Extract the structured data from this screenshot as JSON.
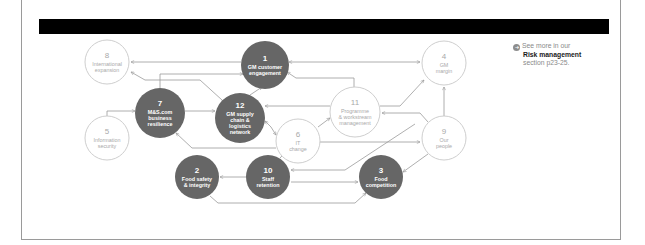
{
  "colors": {
    "filled_node": "#666666",
    "outline_node_stroke": "#c8c8c8",
    "outline_text": "#a9a9a9",
    "connector": "#9a9a9a",
    "redaction": "#000000",
    "frame_border": "#9a9a9a"
  },
  "note": {
    "icon": "more-info-icon",
    "line1": "See more in our",
    "line2": "Risk management",
    "line3": "section p23-25."
  },
  "nodes": [
    {
      "id": "1",
      "number": "1",
      "lines": [
        "GM customer",
        "engagement"
      ],
      "style": "filled",
      "cx": 265,
      "cy": 65,
      "r": 24
    },
    {
      "id": "2",
      "number": "2",
      "lines": [
        "Food safety",
        "& integrity"
      ],
      "style": "filled",
      "cx": 197,
      "cy": 177,
      "r": 22
    },
    {
      "id": "3",
      "number": "3",
      "lines": [
        "Food",
        "competition"
      ],
      "style": "filled",
      "cx": 381,
      "cy": 177,
      "r": 22
    },
    {
      "id": "4",
      "number": "4",
      "lines": [
        "GM",
        "margin"
      ],
      "style": "outline",
      "cx": 444,
      "cy": 63,
      "r": 22
    },
    {
      "id": "5",
      "number": "5",
      "lines": [
        "Information",
        "security"
      ],
      "style": "outline",
      "cx": 107,
      "cy": 138,
      "r": 22
    },
    {
      "id": "6",
      "number": "6",
      "lines": [
        "IT",
        "change"
      ],
      "style": "outline",
      "cx": 298,
      "cy": 141,
      "r": 22
    },
    {
      "id": "7",
      "number": "7",
      "lines": [
        "M&S.com",
        "business",
        "resilience"
      ],
      "style": "filled",
      "cx": 160,
      "cy": 113,
      "r": 25
    },
    {
      "id": "8",
      "number": "8",
      "lines": [
        "International",
        "expansion"
      ],
      "style": "outline",
      "cx": 107,
      "cy": 62,
      "r": 22
    },
    {
      "id": "9",
      "number": "9",
      "lines": [
        "Our",
        "people"
      ],
      "style": "outline",
      "cx": 444,
      "cy": 138,
      "r": 22
    },
    {
      "id": "10",
      "number": "10",
      "lines": [
        "Staff",
        "retention"
      ],
      "style": "filled",
      "cx": 268,
      "cy": 177,
      "r": 22
    },
    {
      "id": "11",
      "number": "11",
      "lines": [
        "Programme",
        "& workstream",
        "management"
      ],
      "style": "outline",
      "cx": 355,
      "cy": 112,
      "r": 25
    },
    {
      "id": "12",
      "number": "12",
      "lines": [
        "GM supply",
        "chain &",
        "logistics",
        "network"
      ],
      "style": "filled",
      "cx": 240,
      "cy": 118,
      "r": 25
    }
  ],
  "connectors": [
    {
      "from": "1",
      "to": "8",
      "points": "241,62 131,62",
      "heads": [
        "end"
      ]
    },
    {
      "from": "1",
      "to": "4",
      "points": "289,62 420,62",
      "heads": [
        "start",
        "end"
      ]
    },
    {
      "from": "12",
      "to": "8",
      "points": "222,100 200,80 145,80 131,72",
      "heads": [
        "end"
      ]
    },
    {
      "from": "7",
      "to": "1",
      "points": "160,88 160,74 243,74",
      "heads": [
        "end"
      ]
    },
    {
      "from": "12",
      "to": "1",
      "points": "250,95 262,87",
      "heads": [
        "end"
      ]
    },
    {
      "from": "11",
      "to": "1",
      "points": "354,87 354,78 296,78 287,72",
      "heads": [
        "end"
      ]
    },
    {
      "from": "5",
      "to": "7",
      "points": "107,116 107,111 135,111",
      "heads": [
        "end"
      ]
    },
    {
      "from": "7",
      "to": "12",
      "points": "185,111 215,111",
      "heads": [
        "end"
      ]
    },
    {
      "from": "11",
      "to": "12",
      "points": "330,106 265,106",
      "heads": [
        "end"
      ]
    },
    {
      "from": "12",
      "to": "6",
      "points": "265,121 271,127 276,135",
      "heads": [
        "start",
        "end"
      ]
    },
    {
      "from": "6",
      "to": "7",
      "points": "276,148 192,148 176,133",
      "heads": [
        "end"
      ]
    },
    {
      "from": "6",
      "to": "11",
      "points": "318,127 330,118",
      "heads": [
        "end"
      ]
    },
    {
      "from": "11",
      "to": "4",
      "points": "380,106 400,106 424,80",
      "heads": [
        "end"
      ]
    },
    {
      "from": "9",
      "to": "4",
      "points": "444,116 444,87",
      "heads": [
        "end"
      ]
    },
    {
      "from": "9",
      "to": "11",
      "points": "428,122 420,113 382,113",
      "heads": [
        "end"
      ]
    },
    {
      "from": "10",
      "to": "9",
      "points": "280,158 295,142 290,142 420,142",
      "heads": [
        "end"
      ]
    },
    {
      "from": "9",
      "to": "3",
      "points": "428,154 403,172",
      "heads": [
        "end"
      ]
    },
    {
      "from": "10",
      "to": "2",
      "points": "246,177 220,177",
      "heads": [
        "end"
      ]
    },
    {
      "from": "11",
      "to": "10",
      "points": "415,124 345,170 291,170",
      "heads": [
        "end"
      ]
    },
    {
      "from": "10",
      "to": "3",
      "points": "291,182 358,182",
      "heads": [
        "end"
      ]
    },
    {
      "from": "2",
      "to": "3",
      "points": "210,196 218,203 355,203 366,193",
      "heads": [
        "end"
      ]
    }
  ]
}
